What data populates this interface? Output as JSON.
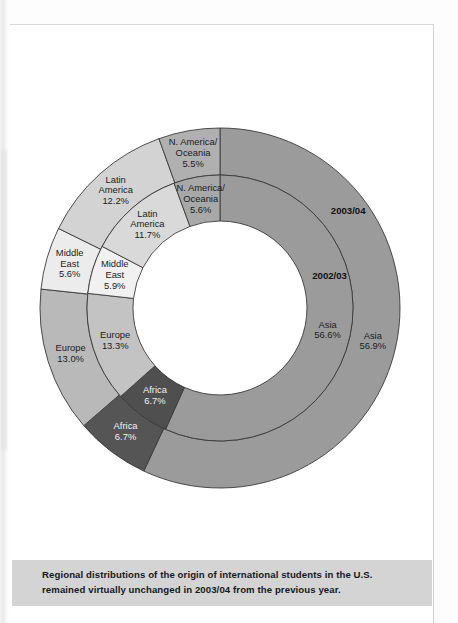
{
  "chart_data": {
    "type": "pie",
    "variant": "nested-donut",
    "title": "",
    "legend_position": "inline-labels",
    "rings": [
      {
        "name": "2003/04",
        "ring": "outer",
        "ring_label": "2003/04",
        "categories": [
          "Asia",
          "Africa",
          "Europe",
          "Middle East",
          "Latin America",
          "N. America/ Oceania"
        ],
        "values": [
          56.9,
          6.7,
          13.0,
          5.6,
          12.2,
          5.5
        ],
        "value_labels": [
          "56.9%",
          "6.7%",
          "13.0%",
          "5.6%",
          "12.2%",
          "5.5%"
        ],
        "colors": [
          "#9b9b9b",
          "#555555",
          "#b9b9b9",
          "#ececec",
          "#d3d3d3",
          "#b0b0b0"
        ]
      },
      {
        "name": "2002/03",
        "ring": "inner",
        "ring_label": "2002/03",
        "categories": [
          "Asia",
          "Africa",
          "Europe",
          "Middle East",
          "Latin America",
          "N. America/ Oceania"
        ],
        "values": [
          56.6,
          6.7,
          13.3,
          5.9,
          11.7,
          5.6
        ],
        "value_labels": [
          "56.6%",
          "6.7%",
          "13.3%",
          "5.9%",
          "11.7%",
          "5.6%"
        ],
        "colors": [
          "#9b9b9b",
          "#4f4f4f",
          "#c3c3c3",
          "#f1f1f1",
          "#d9d9d9",
          "#a8a8a8"
        ]
      }
    ],
    "units": "percent"
  },
  "chart_labels": {
    "outer_year": "2003/04",
    "inner_year": "2002/03",
    "segments_outer": [
      {
        "region": "Asia",
        "pct": "56.9%"
      },
      {
        "region": "Africa",
        "pct": "6.7%"
      },
      {
        "region": "Europe",
        "pct": "13.0%"
      },
      {
        "region": "Middle East",
        "pct": "5.6%"
      },
      {
        "region": "Latin America",
        "pct": "12.2%"
      },
      {
        "region": "N. America/ Oceania",
        "pct": "5.5%"
      }
    ],
    "segments_inner": [
      {
        "region": "Asia",
        "pct": "56.6%"
      },
      {
        "region": "Africa",
        "pct": "6.7%"
      },
      {
        "region": "Europe",
        "pct": "13.3%"
      },
      {
        "region": "Middle East",
        "pct": "5.9%"
      },
      {
        "region": "Latin America",
        "pct": "11.7%"
      },
      {
        "region": "N. America/ Oceania",
        "pct": "5.6%"
      }
    ]
  },
  "caption": {
    "line1": "Regional distributions of the origin of international students in the U.S. remained",
    "line2": "virtually unchanged in 2003/04 from the previous year."
  },
  "colors": {
    "caption_band": "#d4d4d4",
    "page": "#ffffff",
    "stroke": "#3a3a3a"
  }
}
